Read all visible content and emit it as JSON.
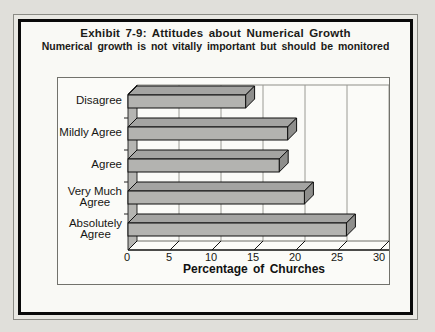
{
  "figure": {
    "title": "Exhibit 7-9: Attitudes about Numerical Growth",
    "subtitle": "Numerical growth is not vitally important but should be monitored"
  },
  "chart_data": {
    "type": "bar",
    "orientation": "horizontal",
    "style": "3d-block-bars",
    "categories": [
      "Disagree",
      "Mildly Agree",
      "Agree",
      "Very Much Agree",
      "Absolutely Agree"
    ],
    "category_lines": [
      [
        "Disagree"
      ],
      [
        "Mildly Agree"
      ],
      [
        "Agree"
      ],
      [
        "Very Much",
        "Agree"
      ],
      [
        "Absolutely",
        "Agree"
      ]
    ],
    "values": [
      14,
      19,
      18,
      21,
      26
    ],
    "xlabel": "Percentage of Churches",
    "xticks": [
      0,
      5,
      10,
      15,
      20,
      25,
      30
    ],
    "xlim": [
      0,
      30
    ],
    "grid": true,
    "legend": false,
    "colors": {
      "bar_front": "#b3b3b0",
      "bar_top": "#a4a4a2",
      "bar_side": "#8e8e8c",
      "bar_outline": "#0f0f0f",
      "axis_wall": "#b5b5b2",
      "gridline": "#9a9a94",
      "frame": "#72726c"
    }
  }
}
